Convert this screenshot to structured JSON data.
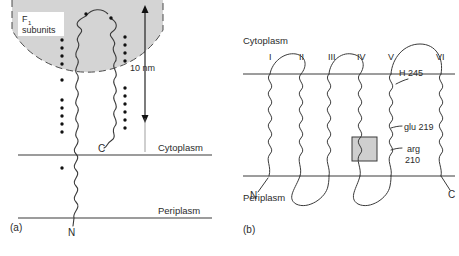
{
  "figure": {
    "panels": [
      {
        "tag": "(a)",
        "title_label": "F₁ subunits",
        "scale_label": "10 nm",
        "membrane_labels": {
          "top": "Cytoplasm",
          "bottom": "Periplasm"
        },
        "terminus_labels": {
          "c": "C",
          "n": "N"
        },
        "dome_fill": "#d4d4d4",
        "dome_stroke": "#4a4a4a",
        "chain_stroke": "#3a3a3a",
        "dot_color": "#111111",
        "dot_columns": [
          {
            "x": 62,
            "ys": [
              40,
              48,
              56,
              64,
              80,
              100,
              108,
              116,
              124,
              132
            ]
          },
          {
            "x": 125,
            "ys": [
              37,
              45,
              53,
              61,
              88,
              96,
              104,
              112,
              120,
              128
            ]
          }
        ],
        "single_dots": [
          {
            "x": 86,
            "y": 14
          },
          {
            "x": 111,
            "y": 18
          },
          {
            "x": 62,
            "y": 168
          }
        ]
      },
      {
        "tag": "(b)",
        "helix_labels": [
          "I",
          "II",
          "III",
          "IV",
          "V",
          "VI"
        ],
        "membrane_labels": {
          "top": "Cytoplasm",
          "bottom": "Periplasm"
        },
        "terminus_labels": {
          "n": "N",
          "c": "C"
        },
        "residues": [
          {
            "name": "H 245",
            "x": 399,
            "y": 78
          },
          {
            "name": "glu 219",
            "x": 399,
            "y": 128
          },
          {
            "name": "arg",
            "x": 401,
            "y": 150
          },
          {
            "name": "210",
            "x": 401,
            "y": 161
          }
        ],
        "highlight_box": {
          "x": 352,
          "y": 137,
          "w": 25,
          "h": 24,
          "fill": "#cfcfcf",
          "stroke": "#3a3a3a"
        },
        "chain_stroke": "#3a3a3a",
        "membrane_stroke": "#3a3a3a"
      }
    ],
    "colors": {
      "background": "#ffffff",
      "ink": "#2b2b2b",
      "membrane_line": "#3a3a3a"
    }
  }
}
